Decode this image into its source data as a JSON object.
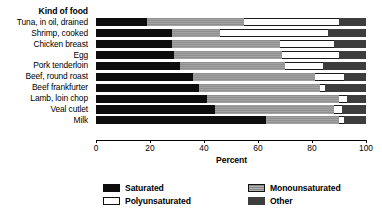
{
  "chart_data": {
    "type": "bar",
    "orientation": "horizontal",
    "stacked": true,
    "title": "",
    "category_axis_title": "Kind of food",
    "xlabel": "Percent",
    "ylabel": "",
    "xlim": [
      0,
      100
    ],
    "xticks": [
      0,
      20,
      40,
      60,
      80,
      100
    ],
    "grid": false,
    "legend_position": "bottom",
    "series_order": [
      "Saturated",
      "Monounsaturated",
      "Polyunsaturated",
      "Other"
    ],
    "series": [
      {
        "name": "Saturated",
        "color": "#0d0d0d",
        "values": [
          19,
          28,
          28,
          29,
          31,
          36,
          38,
          41,
          44,
          63
        ]
      },
      {
        "name": "Monounsaturated",
        "color": "#9a9a9a",
        "values": [
          36,
          18,
          40,
          40,
          39,
          45,
          45,
          49,
          44,
          27
        ]
      },
      {
        "name": "Polyunsaturated",
        "color": "#ffffff",
        "values": [
          35,
          40,
          20,
          21,
          14,
          11,
          2,
          3,
          3,
          2
        ]
      },
      {
        "name": "Other",
        "color": "#3d3d3d",
        "values": [
          10,
          14,
          12,
          10,
          16,
          8,
          15,
          7,
          9,
          8
        ]
      }
    ],
    "categories": [
      "Tuna, in oil, drained",
      "Shrimp, cooked",
      "Chicken breast",
      "Egg",
      "Pork tenderloin",
      "Beef, round roast",
      "Beef frankfurter",
      "Lamb, loin chop",
      "Veal cutlet",
      "Milk"
    ]
  },
  "legend": {
    "items": [
      {
        "label": "Saturated",
        "swatch": "sat"
      },
      {
        "label": "Monounsaturated",
        "swatch": "mono"
      },
      {
        "label": "Polyunsaturated",
        "swatch": "poly"
      },
      {
        "label": "Other",
        "swatch": "other"
      }
    ]
  }
}
